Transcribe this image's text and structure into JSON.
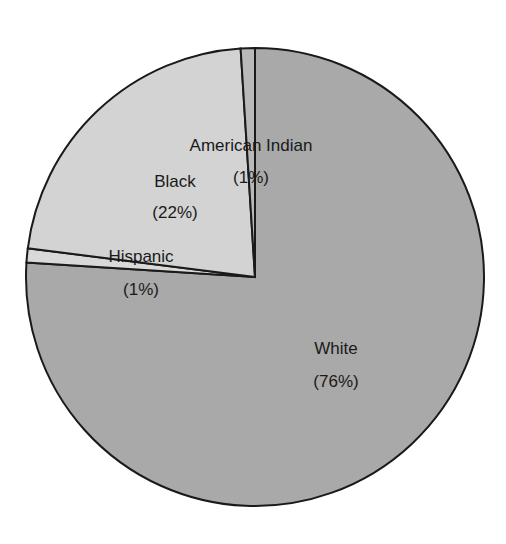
{
  "chart_data": {
    "type": "pie",
    "title": "",
    "start_angle_deg": 0,
    "direction": "clockwise",
    "slices": [
      {
        "label": "White",
        "value": 76,
        "display": "(76%)",
        "color": "#a9a9a9"
      },
      {
        "label": "Hispanic",
        "value": 1,
        "display": "(1%)",
        "color": "#d9d9d9"
      },
      {
        "label": "Black",
        "value": 22,
        "display": "(22%)",
        "color": "#d3d3d3"
      },
      {
        "label": "American Indian",
        "value": 1,
        "display": "(1%)",
        "color": "#b9b9b9"
      }
    ],
    "legend": "none",
    "stroke_color": "#1a1a1a"
  },
  "labels": {
    "white_name": "White",
    "white_pct": "(76%)",
    "hispanic_name": "Hispanic",
    "hispanic_pct": "(1%)",
    "black_name": "Black",
    "black_pct": "(22%)",
    "amind_name": "American Indian",
    "amind_pct": "(1%)"
  }
}
